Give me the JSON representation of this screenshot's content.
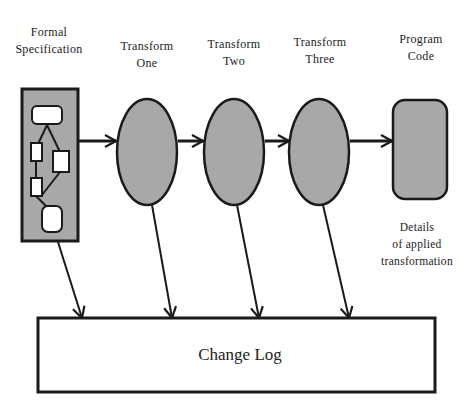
{
  "diagram": {
    "nodes": {
      "formal_spec": {
        "line1": "Formal",
        "line2": "Specification"
      },
      "transform_one": {
        "line1": "Transform",
        "line2": "One"
      },
      "transform_two": {
        "line1": "Transform",
        "line2": "Two"
      },
      "transform_three": {
        "line1": "Transform",
        "line2": "Three"
      },
      "program_code": {
        "line1": "Program",
        "line2": "Code"
      }
    },
    "annotation": {
      "line1": "Details",
      "line2": "of applied",
      "line3": "transformation"
    },
    "change_log": {
      "label": "Change Log"
    },
    "colors": {
      "shape_fill": "#a8a8a8",
      "stroke": "#1a1a1a",
      "box_fill": "#ffffff"
    }
  }
}
